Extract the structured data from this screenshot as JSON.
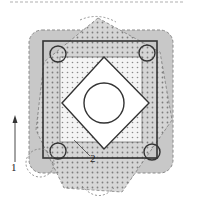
{
  "figure": {
    "caption_visible": "",
    "labels": {
      "arrow_label": "1",
      "region_label": "2"
    },
    "colors": {
      "outer_fill": "#c8c8c8",
      "outer_dash": "#8a8a8a",
      "frame_stroke": "#333333",
      "dot_color": "#7a7a7a",
      "light_fill": "#f4f4f4",
      "white": "#ffffff"
    },
    "shapes": [
      {
        "name": "outer-rounded-square",
        "style": "gray fill, dashed border"
      },
      {
        "name": "rotated-dotted-square",
        "style": "dotted pattern, dashed border, rotated"
      },
      {
        "name": "frame-square",
        "style": "dark solid outline"
      },
      {
        "name": "corner-circles",
        "count": 4
      },
      {
        "name": "inner-dotted-square",
        "style": "light dotted fill"
      },
      {
        "name": "diamond",
        "style": "white, outlined"
      },
      {
        "name": "center-circle",
        "style": "white, outlined"
      }
    ]
  }
}
